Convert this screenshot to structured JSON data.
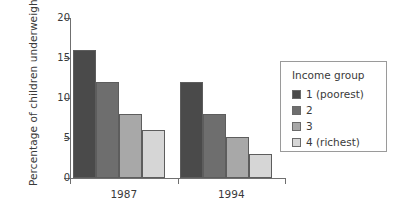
{
  "chart_data": {
    "type": "bar",
    "title": "",
    "subtitle": "",
    "xlabel": "",
    "ylabel": "Percentage of children underweight",
    "categories": [
      "1987",
      "1994"
    ],
    "ylim": [
      0,
      20
    ],
    "yticks": [
      0,
      5,
      10,
      15,
      20
    ],
    "ytick_labels": [
      "0",
      "5",
      "10",
      "15",
      "20"
    ],
    "grid": false,
    "legend_position": "right",
    "legend_title": "Income group",
    "series": [
      {
        "name": "1 (poorest)",
        "color": "#4a4a4a",
        "values": [
          16,
          12
        ]
      },
      {
        "name": "2",
        "color": "#6e6e6e",
        "values": [
          12,
          8
        ]
      },
      {
        "name": "3",
        "color": "#a8a8a8",
        "values": [
          8,
          5.1
        ]
      },
      {
        "name": "4 (richest)",
        "color": "#d6d6d6",
        "values": [
          6,
          3
        ]
      }
    ],
    "annotations": []
  },
  "axes": {
    "y_title": "Percentage of children underweight",
    "y_tick_labels": [
      "20",
      "15",
      "10",
      "5",
      "0"
    ],
    "x_tick_labels": [
      "1987",
      "1994"
    ]
  },
  "legend": {
    "title": "Income group",
    "entries": [
      {
        "label": "1 (poorest)",
        "color": "#4a4a4a"
      },
      {
        "label": "2",
        "color": "#6e6e6e"
      },
      {
        "label": "3",
        "color": "#a8a8a8"
      },
      {
        "label": "4 (richest)",
        "color": "#d6d6d6"
      }
    ]
  },
  "colors": {
    "axis": "#6f6f6f",
    "text": "#3a3a3a",
    "legend_border": "#9a9a9a",
    "bar_border": "#5d5d5d",
    "background": "#ffffff"
  }
}
